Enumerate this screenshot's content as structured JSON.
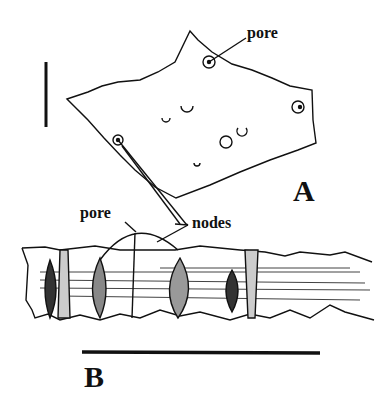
{
  "figure": {
    "panel_a": {
      "label": "A",
      "annotations": [
        "pore"
      ]
    },
    "panel_b": {
      "label": "B",
      "annotations": [
        "pore",
        "nodes"
      ]
    },
    "colors": {
      "ink": "#111111",
      "background": "#ffffff"
    }
  }
}
